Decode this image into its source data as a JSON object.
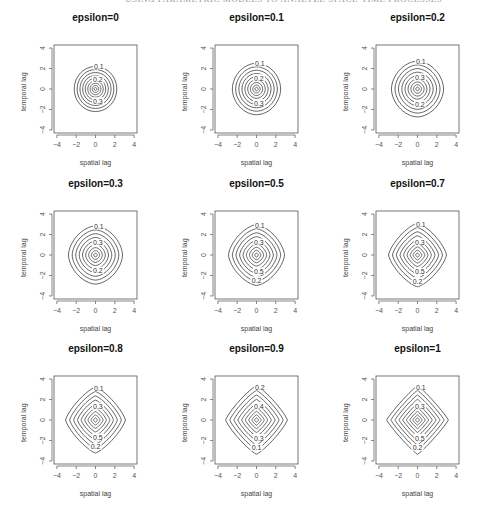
{
  "running_head": {
    "page_number": "---",
    "text": "USING PARAMETRIC MODELS TO ANALYZE SPACE-TIME PROCESSES"
  },
  "chart_data": {
    "type": "contour",
    "layout": "3x3 grid of contour plots",
    "xlabel": "spatial lag",
    "ylabel": "temporal lag",
    "xlim": [
      -4.3,
      4.3
    ],
    "ylim": [
      -4.3,
      4.3
    ],
    "xticks": [
      -4,
      -2,
      0,
      2,
      4
    ],
    "yticks": [
      -4,
      -2,
      0,
      2,
      4
    ],
    "contour_levels": [
      0.1,
      0.2,
      0.3,
      0.4,
      0.5,
      0.6,
      0.7,
      0.8,
      0.9
    ],
    "panels": [
      {
        "title": "epsilon=0",
        "epsilon": 0,
        "labels": [
          "0.1",
          "0.2",
          "0.3"
        ],
        "outer_radius": 2.2,
        "shape": "circle"
      },
      {
        "title": "epsilon=0.1",
        "epsilon": 0.1,
        "labels": [
          "0.1",
          "0.2",
          "0.3"
        ],
        "outer_radius": 2.5,
        "shape": "near-circle"
      },
      {
        "title": "epsilon=0.2",
        "epsilon": 0.2,
        "labels": [
          "0.1",
          "0.3",
          "0.2"
        ],
        "outer_radius": 2.7,
        "shape": "rounded"
      },
      {
        "title": "epsilon=0.3",
        "epsilon": 0.3,
        "labels": [
          "0.1",
          "0.3",
          "0.2"
        ],
        "outer_radius": 2.8,
        "shape": "rounded-diamond"
      },
      {
        "title": "epsilon=0.5",
        "epsilon": 0.5,
        "labels": [
          "0.1",
          "0.3",
          "0.5",
          "0.2"
        ],
        "outer_radius": 2.9,
        "shape": "rounded-diamond"
      },
      {
        "title": "epsilon=0.7",
        "epsilon": 0.7,
        "labels": [
          "0.1",
          "0.3",
          "0.5",
          "0.2"
        ],
        "outer_radius": 3.0,
        "shape": "diamond"
      },
      {
        "title": "epsilon=0.8",
        "epsilon": 0.8,
        "labels": [
          "0.1",
          "0.3",
          "0.5",
          "0.2"
        ],
        "outer_radius": 3.1,
        "shape": "diamond"
      },
      {
        "title": "epsilon=0.9",
        "epsilon": 0.9,
        "labels": [
          "0.2",
          "0.4",
          "0.3",
          "0.1"
        ],
        "outer_radius": 3.2,
        "shape": "diamond"
      },
      {
        "title": "epsilon=1",
        "epsilon": 1,
        "labels": [
          "0.1",
          "0.3",
          "0.5",
          "0.2"
        ],
        "outer_radius": 3.2,
        "shape": "diamond"
      }
    ]
  }
}
